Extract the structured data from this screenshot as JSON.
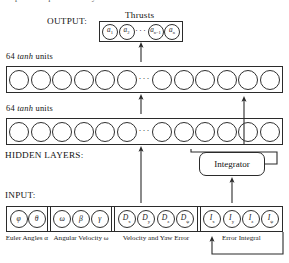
{
  "page": {
    "top_cut_text": "adapt to the quadrotor's dynamics and the control task."
  },
  "labels": {
    "output": "OUTPUT:",
    "hidden_layers": "HIDDEN LAYERS:",
    "input": "INPUT:",
    "thrusts": "Thrusts",
    "hidden_layer_1": "64 tanh units",
    "hidden_layer_2": "64 tanh units",
    "hidden_units_count": "64",
    "hidden_activation": "tanh",
    "hidden_units_word": "units",
    "integrator": "Integrator"
  },
  "output_layer": {
    "title": "Thrusts",
    "nodes": [
      {
        "base": "a",
        "sub": "1"
      },
      {
        "base": "a",
        "sub": "2"
      },
      {
        "ellipsis": "···"
      },
      {
        "base": "a",
        "sub": "n−1"
      },
      {
        "base": "a",
        "sub": "n"
      }
    ]
  },
  "hidden_layers": [
    {
      "label": "64 tanh units",
      "node_count": 12,
      "ellipsis_after": 6
    },
    {
      "label": "64 tanh units",
      "node_count": 12,
      "ellipsis_after": 6
    }
  ],
  "input_layer": {
    "groups": [
      {
        "caption": "Euler Angles α",
        "nodes": [
          {
            "base": "φ",
            "sub": ""
          },
          {
            "base": "θ",
            "sub": ""
          }
        ]
      },
      {
        "caption": "Angular Velocity ω",
        "nodes": [
          {
            "base": "ω",
            "sub": ""
          },
          {
            "base": "β",
            "sub": ""
          },
          {
            "base": "γ",
            "sub": ""
          }
        ]
      },
      {
        "caption": "Velocity and Yaw Error",
        "nodes": [
          {
            "base": "D",
            "sub": "x"
          },
          {
            "base": "D",
            "sub": "y"
          },
          {
            "base": "D",
            "sub": "z"
          },
          {
            "base": "D",
            "sub": "ψ"
          }
        ]
      },
      {
        "caption": "Error Integral",
        "nodes": [
          {
            "base": "I",
            "sub": "x"
          },
          {
            "base": "I",
            "sub": "y"
          },
          {
            "base": "I",
            "sub": "z"
          },
          {
            "base": "I",
            "sub": "ψ"
          }
        ]
      }
    ]
  },
  "colors": {
    "ink": "#2b2b2b",
    "background": "#ffffff",
    "text": "#111111"
  }
}
